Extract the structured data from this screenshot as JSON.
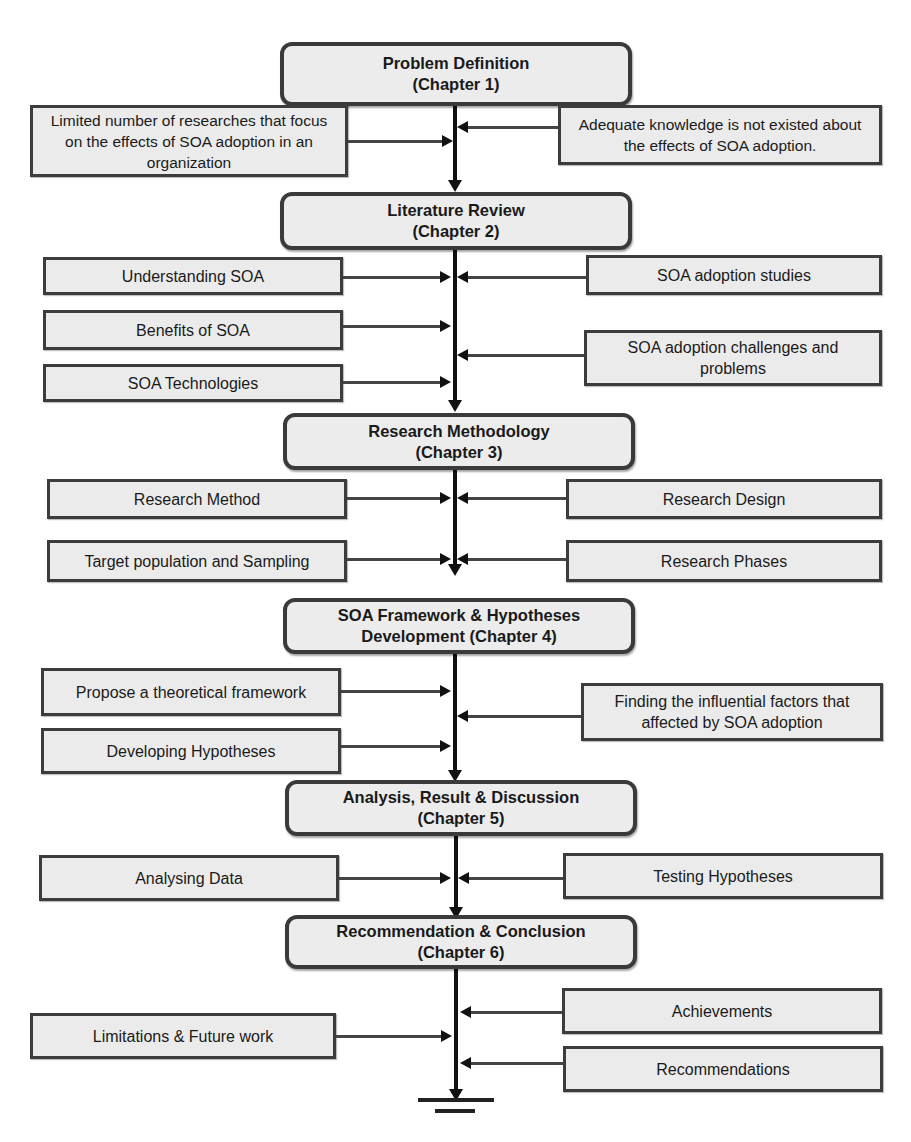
{
  "chapters": [
    {
      "title": "Problem Definition",
      "subtitle": "(Chapter 1)"
    },
    {
      "title": "Literature Review",
      "subtitle": "(Chapter 2)"
    },
    {
      "title": "Research Methodology",
      "subtitle": "(Chapter 3)"
    },
    {
      "title": "SOA Framework & Hypotheses",
      "subtitle": "Development (Chapter 4)"
    },
    {
      "title": "Analysis, Result & Discussion",
      "subtitle": "(Chapter 5)"
    },
    {
      "title": "Recommendation & Conclusion",
      "subtitle": "(Chapter 6)"
    }
  ],
  "ch1": {
    "left": [
      "Limited number of researches that focus on the effects of SOA adoption in an organization"
    ],
    "right": [
      "Adequate knowledge is not existed about the effects of SOA adoption."
    ]
  },
  "ch2": {
    "left": [
      "Understanding SOA",
      "Benefits of SOA",
      "SOA Technologies"
    ],
    "right": [
      "SOA adoption studies",
      "SOA adoption challenges and problems"
    ]
  },
  "ch3": {
    "left": [
      "Research Method",
      "Target population and Sampling"
    ],
    "right": [
      "Research Design",
      "Research Phases"
    ]
  },
  "ch4": {
    "left": [
      "Propose a theoretical framework",
      "Developing Hypotheses"
    ],
    "right": [
      "Finding the influential factors that affected  by SOA adoption"
    ]
  },
  "ch5": {
    "left": [
      "Analysing Data"
    ],
    "right": [
      "Testing Hypotheses"
    ]
  },
  "ch6": {
    "left": [
      "Limitations & Future work"
    ],
    "right": [
      "Achievements",
      "Recommendations"
    ]
  }
}
